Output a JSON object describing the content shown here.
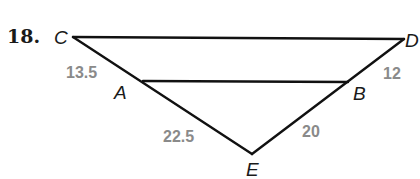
{
  "problem_number": "18.",
  "points": {
    "C": "C",
    "D": "D",
    "A": "A",
    "B": "B",
    "E": "E"
  },
  "segment_lengths": {
    "CA": "13.5",
    "AE": "22.5",
    "DB": "12",
    "BE": "20"
  },
  "segments": [
    "CD",
    "AB",
    "CE",
    "DE"
  ],
  "colors": {
    "line": "#111111",
    "length_label": "#8a8a8a"
  }
}
